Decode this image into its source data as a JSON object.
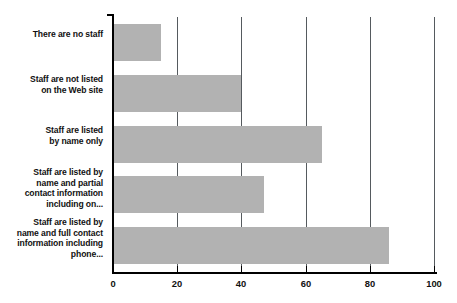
{
  "chart_data": {
    "type": "bar",
    "orientation": "horizontal",
    "title": "",
    "subtitle": "",
    "xlabel": "",
    "ylabel": "",
    "xlim": [
      0,
      100
    ],
    "xticks": [
      0,
      20,
      40,
      60,
      80,
      100
    ],
    "xtick_labels": [
      "0",
      "20",
      "40",
      "60",
      "80",
      "100"
    ],
    "grid": true,
    "grid_axis": "x",
    "legend": false,
    "legend_position": "none",
    "bar_color": "#b2b2b2",
    "axis_color": "#000000",
    "gridline_color": "#555a5e",
    "text_color": "#111111",
    "background_color": "#ffffff",
    "categories": [
      "There are no staff",
      "Staff are not listed on the Web site",
      "Staff are listed by name only",
      "Staff are listed by name and partial contact information including on...",
      "Staff are listed by name and full contact information including phone..."
    ],
    "category_lines": [
      [
        "There are no staff"
      ],
      [
        "Staff are not listed",
        "on the Web site"
      ],
      [
        "Staff are listed",
        "by name only"
      ],
      [
        "Staff are listed by",
        "name and partial",
        "contact information",
        "including on..."
      ],
      [
        "Staff are listed by",
        "name and full contact",
        "information including",
        "phone..."
      ]
    ],
    "values": [
      15,
      40,
      65,
      47,
      86
    ],
    "series": [
      {
        "name": "",
        "values": [
          15,
          40,
          65,
          47,
          86
        ]
      }
    ]
  }
}
